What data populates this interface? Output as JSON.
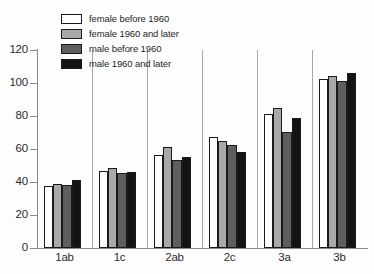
{
  "chart_data": {
    "type": "bar",
    "title": "",
    "subtitle": "",
    "xlabel": "",
    "ylabel": "",
    "categories": [
      "1ab",
      "1c",
      "2ab",
      "2c",
      "3a",
      "3b"
    ],
    "series": [
      {
        "name": "female before 1960",
        "color": "#ffffff",
        "values": [
          37.5,
          46.5,
          56.5,
          67.0,
          81.0,
          102.5
        ]
      },
      {
        "name": "female 1960 and later",
        "color": "#a9a9a9",
        "values": [
          39.0,
          48.5,
          61.0,
          65.0,
          85.0,
          104.5
        ]
      },
      {
        "name": "male before 1960",
        "color": "#5e5e5e",
        "values": [
          38.0,
          45.5,
          53.5,
          62.5,
          70.5,
          101.0
        ]
      },
      {
        "name": "male 1960 and later",
        "color": "#131313",
        "values": [
          41.0,
          46.0,
          55.0,
          58.0,
          79.0,
          106.0
        ]
      }
    ],
    "ylim": [
      0,
      120
    ],
    "yticks": [
      0,
      20,
      40,
      60,
      80,
      100,
      120
    ],
    "ytick_labels": [
      "0",
      "20",
      "40",
      "60",
      "80",
      "100",
      "120"
    ],
    "grid": false,
    "legend_position": "upper left",
    "group_separators": true
  },
  "legend": {
    "entries": [
      {
        "label": "female before 1960"
      },
      {
        "label": "female 1960 and later"
      },
      {
        "label": "male before 1960"
      },
      {
        "label": "male 1960 and later"
      }
    ]
  }
}
